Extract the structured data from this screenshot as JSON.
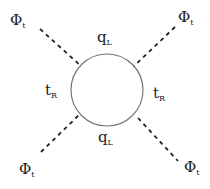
{
  "diagram": {
    "type": "feynman-loop",
    "loop": {
      "cx": 107,
      "cy": 90,
      "r": 36,
      "color": "#777777"
    },
    "labels": {
      "phi_tl": {
        "main": "Φ",
        "sub": "t"
      },
      "phi_tr": {
        "main": "Φ",
        "sub": "t"
      },
      "phi_bl": {
        "main": "Φ",
        "sub": "t"
      },
      "phi_br": {
        "main": "Φ",
        "sub": "t"
      },
      "q_top": {
        "main": "q",
        "sub": "L"
      },
      "q_bottom": {
        "main": "q",
        "sub": "L"
      },
      "t_left": {
        "main": "t",
        "sub": "R"
      },
      "t_right": {
        "main": "t",
        "sub": "R"
      }
    },
    "external_lines": [
      {
        "name": "top-left",
        "x1": 40,
        "y1": 29,
        "x2": 81,
        "y2": 66
      },
      {
        "name": "top-right",
        "x1": 175,
        "y1": 27,
        "x2": 134,
        "y2": 66
      },
      {
        "name": "bottom-left",
        "x1": 41,
        "y1": 152,
        "x2": 80,
        "y2": 114
      },
      {
        "name": "bottom-right",
        "x1": 138,
        "y1": 118,
        "x2": 178,
        "y2": 161
      }
    ]
  }
}
